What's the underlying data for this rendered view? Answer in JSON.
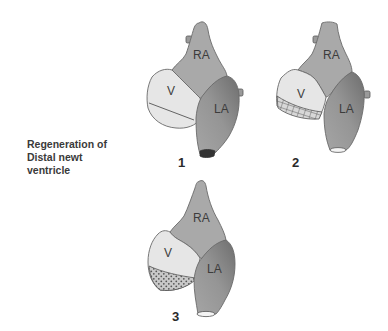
{
  "caption": {
    "lines": [
      "Regeneration of",
      "Distal newt",
      "ventricle"
    ]
  },
  "hearts": [
    {
      "stage": "1",
      "labels": {
        "ra": "RA",
        "v": "V",
        "la": "LA"
      },
      "ventricle_state": "amputation line"
    },
    {
      "stage": "2",
      "labels": {
        "ra": "RA",
        "v": "V",
        "la": "LA"
      },
      "ventricle_state": "wound hatched region"
    },
    {
      "stage": "3",
      "labels": {
        "ra": "RA",
        "v": "V",
        "la": "LA"
      },
      "ventricle_state": "regenerating dotted region"
    }
  ],
  "colors": {
    "ra": "#a9a9a9",
    "la_light": "#9a9a9a",
    "la_dark": "#7a7a7a",
    "v": "#e6e6e6",
    "outline": "#6a6a6a"
  }
}
